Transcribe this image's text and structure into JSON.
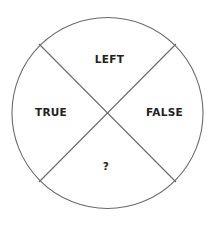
{
  "diagram": {
    "type": "quartered-circle",
    "stroke_color": "#6a6a6a",
    "text_color": "#222222",
    "circle": {
      "cx": 107.5,
      "cy": 113,
      "r": 95.5
    },
    "chords": [
      {
        "x1": 39,
        "y1": 44,
        "x2": 176,
        "y2": 182
      },
      {
        "x1": 176,
        "y1": 44,
        "x2": 39,
        "y2": 182
      }
    ],
    "quadrants": {
      "top": {
        "label": "LEFT",
        "x": 109.5,
        "y": 59
      },
      "left": {
        "label": "TRUE",
        "x": 51,
        "y": 112
      },
      "right": {
        "label": "FALSE",
        "x": 164.5,
        "y": 112
      },
      "bottom": {
        "label": "?",
        "x": 106,
        "y": 165.5
      }
    }
  }
}
